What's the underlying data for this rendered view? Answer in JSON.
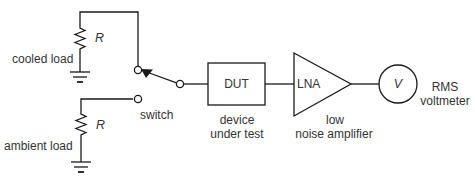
{
  "diagram": {
    "components": {
      "cooled_load": {
        "label": "cooled load",
        "resistor_label": "R"
      },
      "ambient_load": {
        "label": "ambient load",
        "resistor_label": "R"
      },
      "switch": {
        "label": "switch"
      },
      "dut": {
        "box_text": "DUT",
        "caption_line1": "device",
        "caption_line2": "under test"
      },
      "lna": {
        "box_text": "LNA",
        "caption_line1": "low",
        "caption_line2": "noise amplifier"
      },
      "voltmeter": {
        "symbol": "V",
        "caption_line1": "RMS",
        "caption_line2": "voltmeter"
      }
    },
    "connections": [
      [
        "cooled_load",
        "switch"
      ],
      [
        "ambient_load",
        "switch"
      ],
      [
        "switch",
        "dut"
      ],
      [
        "dut",
        "lna"
      ],
      [
        "lna",
        "voltmeter"
      ]
    ],
    "colors": {
      "line": "#1a1a1a",
      "text": "#333333",
      "background": "#ffffff"
    }
  }
}
